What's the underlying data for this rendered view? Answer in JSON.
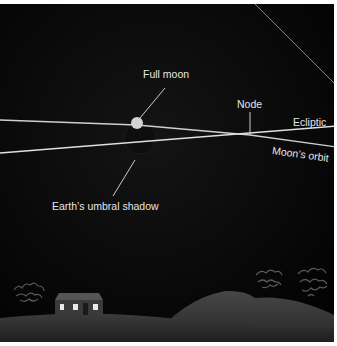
{
  "diagram": {
    "labels": {
      "full_moon": "Full moon",
      "node": "Node",
      "ecliptic": "Ecliptic",
      "moons_orbit": "Moon’s orbit",
      "umbral_shadow": "Earth’s umbral shadow"
    },
    "colors": {
      "sky": "#050505",
      "line": "#d9d9d9",
      "moon": "#cfcfcf",
      "shadow": "#111111",
      "ground": "#2b2b2b",
      "hill": "#3a3a3a",
      "window": "#e8e8e8"
    }
  }
}
